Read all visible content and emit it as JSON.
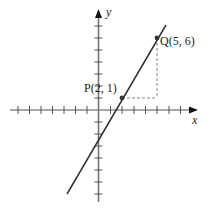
{
  "diagram": {
    "type": "coordinate-plane",
    "axes": {
      "x_label": "x",
      "y_label": "y",
      "x_ticks": [
        -7,
        -6,
        -5,
        -4,
        -3,
        -2,
        -1,
        1,
        2,
        3,
        4,
        5,
        6,
        7
      ],
      "y_ticks": [
        -7,
        -6,
        -5,
        -4,
        -3,
        -2,
        -1,
        1,
        2,
        3,
        4,
        5,
        6,
        7
      ]
    },
    "points": [
      {
        "name": "P",
        "label": "P(2, 1)",
        "x": 2,
        "y": 1
      },
      {
        "name": "Q",
        "label": "Q(5, 6)",
        "x": 5,
        "y": 6
      }
    ],
    "line": {
      "through": [
        "P",
        "Q"
      ],
      "slope": "5/3"
    },
    "dashed_guides": "horizontal from P to x=5, vertical from Q down to y=1",
    "colors": {
      "axes": "#555555",
      "line": "#333333",
      "dashed": "#888888"
    }
  }
}
